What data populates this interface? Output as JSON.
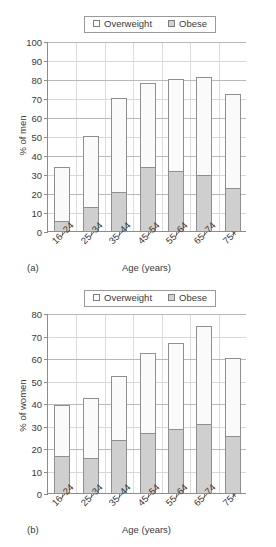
{
  "chart_data": [
    {
      "id": "men",
      "type": "bar",
      "stacked": true,
      "panel_letter": "(a)",
      "title": "",
      "xlabel": "Age (years)",
      "ylabel": "% of men",
      "ylim": [
        0,
        100
      ],
      "ytick_step": 10,
      "yticks": [
        0,
        10,
        20,
        30,
        40,
        50,
        60,
        70,
        80,
        90,
        100
      ],
      "grid": true,
      "legend_position": "top-center",
      "categories": [
        "16–24",
        "25–34",
        "35–44",
        "45–54",
        "55–64",
        "65–74",
        "75+"
      ],
      "series": [
        {
          "name": "Obese",
          "values": [
            6,
            13,
            21,
            34,
            32,
            30,
            23
          ],
          "color": "#cfcfcf"
        },
        {
          "name": "Overweight",
          "values": [
            29,
            38,
            50,
            45,
            49,
            52,
            50
          ],
          "color": "#fafafa"
        }
      ],
      "totals": [
        35,
        51,
        71,
        79,
        81,
        82,
        73
      ]
    },
    {
      "id": "women",
      "type": "bar",
      "stacked": true,
      "panel_letter": "(b)",
      "title": "",
      "xlabel": "Age (years)",
      "ylabel": "% of women",
      "ylim": [
        0,
        80
      ],
      "ytick_step": 10,
      "yticks": [
        0,
        10,
        20,
        30,
        40,
        50,
        60,
        70,
        80
      ],
      "grid": true,
      "legend_position": "top-center",
      "categories": [
        "16–24",
        "25–34",
        "35–44",
        "45–54",
        "55–64",
        "65–74",
        "75+"
      ],
      "series": [
        {
          "name": "Obese",
          "values": [
            17,
            16,
            24,
            27,
            29,
            31,
            26
          ],
          "color": "#cfcfcf"
        },
        {
          "name": "Overweight",
          "values": [
            23,
            27,
            29,
            36,
            38.5,
            44,
            35
          ],
          "color": "#fafafa"
        }
      ],
      "totals": [
        40,
        43,
        53,
        63,
        67.5,
        75,
        61
      ]
    }
  ],
  "legend": {
    "overweight_label": "Overweight",
    "obese_label": "Obese",
    "overweight_color": "#fafafa",
    "obese_color": "#cfcfcf"
  }
}
